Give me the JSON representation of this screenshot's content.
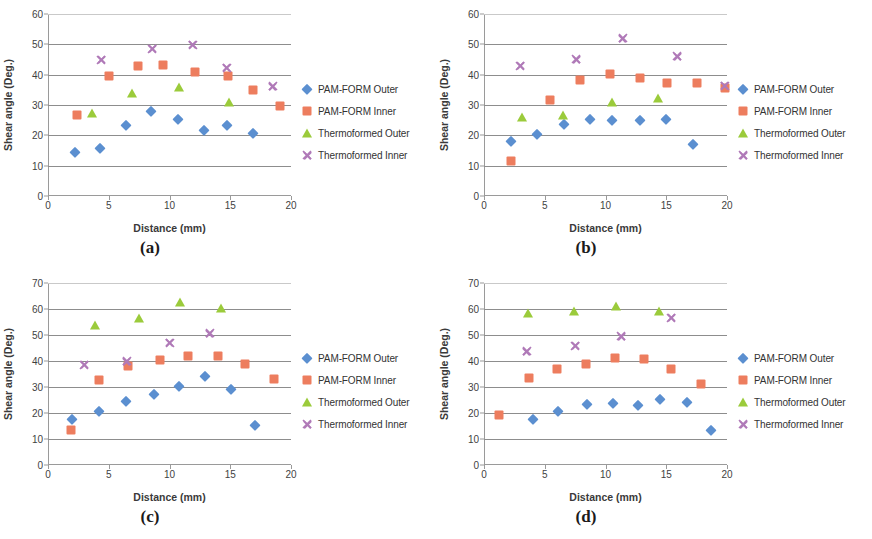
{
  "figure": {
    "series_names": [
      "PAM-FORM Outer",
      "PAM-FORM Inner",
      "Thermoformed Outer",
      "Thermoformed Inner"
    ],
    "marker_icons": [
      "diamond-marker",
      "square-marker",
      "triangle-marker",
      "cross-marker"
    ],
    "colors": {
      "pam_form_outer": "#5b8fd0",
      "pam_form_inner": "#ed7d5e",
      "thermoformed_outer": "#9bcb3b",
      "thermoformed_inner": "#b07ab8",
      "gridline": "#8d8d8d",
      "axis": "#9a9a9a"
    },
    "captions": {
      "a": "(a)",
      "b": "(b)",
      "c": "(c)",
      "d": "(d)"
    }
  },
  "chart_data": [
    {
      "panel": "a",
      "type": "scatter",
      "title": "(a)",
      "xlabel": "Distance (mm)",
      "ylabel": "Shear angle (Deg.)",
      "xlim": [
        0,
        20
      ],
      "ylim": [
        0,
        60
      ],
      "xticks": [
        0,
        5,
        10,
        15,
        20
      ],
      "yticks": [
        0,
        10,
        20,
        30,
        40,
        50,
        60
      ],
      "grid": "horizontal",
      "legend_position": "right",
      "series": [
        {
          "name": "PAM-FORM Outer",
          "marker": "diamond",
          "color": "#5b8fd0",
          "points": [
            [
              2.2,
              14.4
            ],
            [
              4.3,
              15.9
            ],
            [
              6.4,
              23.4
            ],
            [
              8.5,
              28.0
            ],
            [
              10.7,
              25.3
            ],
            [
              12.8,
              21.6
            ],
            [
              14.7,
              23.4
            ],
            [
              16.9,
              20.9
            ]
          ]
        },
        {
          "name": "PAM-FORM Inner",
          "marker": "square",
          "color": "#ed7d5e",
          "points": [
            [
              2.4,
              26.6
            ],
            [
              5.0,
              39.4
            ],
            [
              7.4,
              43.0
            ],
            [
              9.5,
              43.1
            ],
            [
              12.1,
              41.0
            ],
            [
              14.8,
              39.5
            ],
            [
              16.9,
              34.9
            ],
            [
              19.1,
              29.6
            ]
          ]
        },
        {
          "name": "Thermoformed Outer",
          "marker": "triangle",
          "color": "#9bcb3b",
          "points": [
            [
              3.6,
              27.4
            ],
            [
              6.9,
              33.9
            ],
            [
              10.8,
              36.0
            ],
            [
              14.9,
              31.0
            ]
          ]
        },
        {
          "name": "Thermoformed Inner",
          "marker": "cross",
          "color": "#b07ab8",
          "points": [
            [
              4.4,
              44.9
            ],
            [
              8.6,
              48.5
            ],
            [
              11.9,
              49.8
            ],
            [
              14.7,
              42.2
            ],
            [
              18.5,
              36.1
            ]
          ]
        }
      ]
    },
    {
      "panel": "b",
      "type": "scatter",
      "title": "(b)",
      "xlabel": "Distance (mm)",
      "ylabel": "Shear angle (Deg.)",
      "xlim": [
        0,
        20
      ],
      "ylim": [
        0,
        60
      ],
      "xticks": [
        0,
        5,
        10,
        15,
        20
      ],
      "yticks": [
        0,
        10,
        20,
        30,
        40,
        50,
        60
      ],
      "grid": "horizontal",
      "legend_position": "right",
      "series": [
        {
          "name": "PAM-FORM Outer",
          "marker": "diamond",
          "color": "#5b8fd0",
          "points": [
            [
              2.2,
              18.0
            ],
            [
              4.4,
              20.6
            ],
            [
              6.6,
              23.6
            ],
            [
              8.7,
              25.5
            ],
            [
              10.5,
              25.2
            ],
            [
              12.8,
              25.0
            ],
            [
              15.0,
              25.5
            ],
            [
              17.2,
              17.1
            ]
          ]
        },
        {
          "name": "PAM-FORM Inner",
          "marker": "square",
          "color": "#ed7d5e",
          "points": [
            [
              2.2,
              11.6
            ],
            [
              5.4,
              31.5
            ],
            [
              7.9,
              38.1
            ],
            [
              10.4,
              40.2
            ],
            [
              12.8,
              39.0
            ],
            [
              15.1,
              37.1
            ],
            [
              17.5,
              37.2
            ],
            [
              19.8,
              35.7
            ]
          ]
        },
        {
          "name": "Thermoformed Outer",
          "marker": "triangle",
          "color": "#9bcb3b",
          "points": [
            [
              3.1,
              25.9
            ],
            [
              6.5,
              26.6
            ],
            [
              10.5,
              30.9
            ],
            [
              14.3,
              32.3
            ]
          ]
        },
        {
          "name": "Thermoformed Inner",
          "marker": "cross",
          "color": "#b07ab8",
          "points": [
            [
              3.0,
              43.0
            ],
            [
              7.6,
              45.1
            ],
            [
              11.4,
              52.0
            ],
            [
              15.9,
              46.0
            ],
            [
              19.8,
              36.4
            ]
          ]
        }
      ]
    },
    {
      "panel": "c",
      "type": "scatter",
      "title": "(c)",
      "xlabel": "Distance (mm)",
      "ylabel": "Shear angle (Deg.)",
      "xlim": [
        0,
        20
      ],
      "ylim": [
        0,
        70
      ],
      "xticks": [
        0,
        5,
        10,
        15,
        20
      ],
      "yticks": [
        0,
        10,
        20,
        30,
        40,
        50,
        60,
        70
      ],
      "grid": "horizontal",
      "legend_position": "right",
      "series": [
        {
          "name": "PAM-FORM Outer",
          "marker": "diamond",
          "color": "#5b8fd0",
          "points": [
            [
              2.0,
              17.8
            ],
            [
              4.2,
              20.9
            ],
            [
              6.4,
              24.8
            ],
            [
              8.7,
              27.5
            ],
            [
              10.8,
              30.4
            ],
            [
              12.9,
              34.4
            ],
            [
              15.1,
              29.2
            ],
            [
              17.0,
              15.3
            ]
          ]
        },
        {
          "name": "PAM-FORM Inner",
          "marker": "square",
          "color": "#ed7d5e",
          "points": [
            [
              1.9,
              13.6
            ],
            [
              4.2,
              32.6
            ],
            [
              6.6,
              37.9
            ],
            [
              9.2,
              40.2
            ],
            [
              11.5,
              41.9
            ],
            [
              14.0,
              42.1
            ],
            [
              16.2,
              39.0
            ],
            [
              18.6,
              33.0
            ]
          ]
        },
        {
          "name": "Thermoformed Outer",
          "marker": "triangle",
          "color": "#9bcb3b",
          "points": [
            [
              3.9,
              53.8
            ],
            [
              7.5,
              56.5
            ],
            [
              10.9,
              62.8
            ],
            [
              14.2,
              60.2
            ]
          ]
        },
        {
          "name": "Thermoformed Inner",
          "marker": "cross",
          "color": "#b07ab8",
          "points": [
            [
              3.0,
              38.6
            ],
            [
              6.5,
              40.0
            ],
            [
              10.0,
              47.0
            ],
            [
              13.3,
              50.6
            ]
          ]
        }
      ]
    },
    {
      "panel": "d",
      "type": "scatter",
      "title": "(d)",
      "xlabel": "Distance (mm)",
      "ylabel": "Shear angle (Deg.)",
      "xlim": [
        0,
        20
      ],
      "ylim": [
        0,
        70
      ],
      "xticks": [
        0,
        5,
        10,
        15,
        20
      ],
      "yticks": [
        0,
        10,
        20,
        30,
        40,
        50,
        60,
        70
      ],
      "grid": "horizontal",
      "legend_position": "right",
      "series": [
        {
          "name": "PAM-FORM Outer",
          "marker": "diamond",
          "color": "#5b8fd0",
          "points": [
            [
              4.0,
              17.6
            ],
            [
              6.1,
              20.7
            ],
            [
              8.5,
              23.3
            ],
            [
              10.6,
              23.9
            ],
            [
              12.7,
              23.1
            ],
            [
              14.5,
              25.5
            ],
            [
              16.7,
              24.4
            ],
            [
              18.7,
              13.4
            ]
          ]
        },
        {
          "name": "PAM-FORM Inner",
          "marker": "square",
          "color": "#ed7d5e",
          "points": [
            [
              1.2,
              19.4
            ],
            [
              3.7,
              33.6
            ],
            [
              6.0,
              36.8
            ],
            [
              8.4,
              39.0
            ],
            [
              10.8,
              41.0
            ],
            [
              13.2,
              40.8
            ],
            [
              15.4,
              37.1
            ],
            [
              17.9,
              31.3
            ]
          ]
        },
        {
          "name": "Thermoformed Outer",
          "marker": "triangle",
          "color": "#9bcb3b",
          "points": [
            [
              3.6,
              58.6
            ],
            [
              7.4,
              59.1
            ],
            [
              10.9,
              61.2
            ],
            [
              14.4,
              59.4
            ]
          ]
        },
        {
          "name": "Thermoformed Inner",
          "marker": "cross",
          "color": "#b07ab8",
          "points": [
            [
              3.5,
              43.8
            ],
            [
              7.5,
              45.9
            ],
            [
              11.3,
              49.6
            ],
            [
              15.4,
              56.7
            ]
          ]
        }
      ]
    }
  ]
}
